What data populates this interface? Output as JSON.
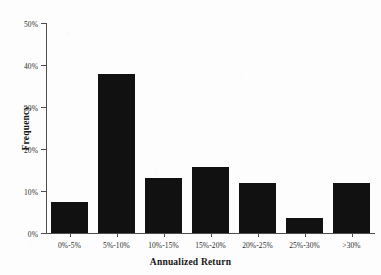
{
  "chart_data": {
    "type": "bar",
    "title": "",
    "subtitle": "",
    "xlabel": "Annualized Return",
    "ylabel": "Frequency",
    "categories": [
      "0%-5%",
      "5%-10%",
      "10%-15%",
      "15%-20%",
      "20%-25%",
      "25%-30%",
      ">30%"
    ],
    "values": [
      7.4,
      37.9,
      13.1,
      15.7,
      11.9,
      3.6,
      11.9
    ],
    "ylim": [
      0,
      50
    ],
    "yticks": [
      0,
      10,
      20,
      30,
      40,
      50
    ],
    "ytick_labels": [
      "0%",
      "10%",
      "20%",
      "30%",
      "40%",
      "50%"
    ],
    "grid": false,
    "legend": false,
    "bar_color": "#111111",
    "axis_color": "#4d4d4d",
    "background_color": "#fdfdfd"
  }
}
